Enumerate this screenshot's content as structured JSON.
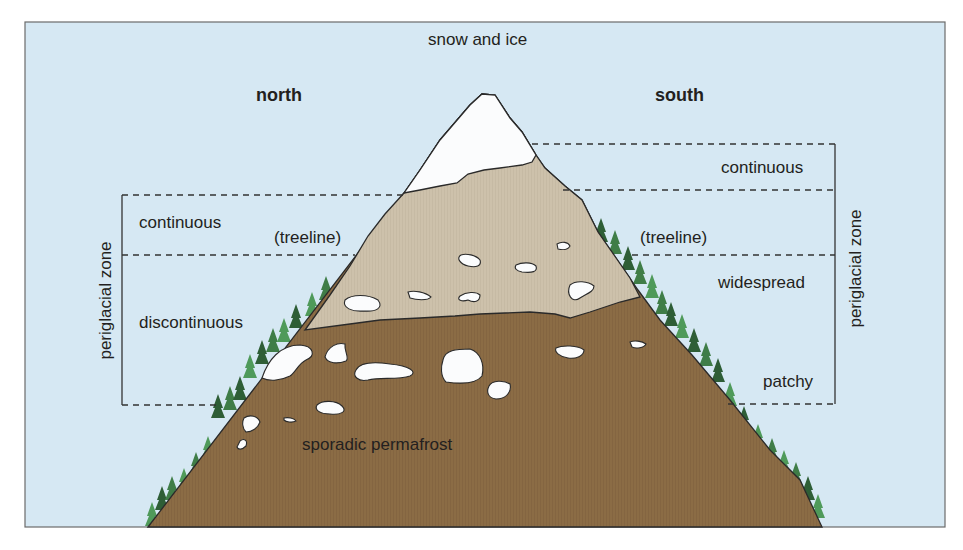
{
  "diagram": {
    "title_top": "snow and ice",
    "aspects": {
      "left": "north",
      "right": "south"
    },
    "north_zones": [
      {
        "label": "continuous",
        "y_top": 195,
        "y_bottom": 255
      },
      {
        "label": "discontinuous",
        "y_top": 255,
        "y_bottom": 405
      }
    ],
    "south_zones": [
      {
        "label": "continuous",
        "y_top": 144,
        "y_bottom": 190
      },
      {
        "label": "widespread",
        "y_top": 255,
        "y_bottom": 300
      },
      {
        "label": "patchy",
        "y_top": 300,
        "y_bottom": 404
      }
    ],
    "treeline_left": "(treeline)",
    "treeline_right": "(treeline)",
    "bracket_label_left": "periglacial zone",
    "bracket_label_right": "periglacial zone",
    "base_label": "sporadic permafrost"
  },
  "colors": {
    "sky": "#d6e8f3",
    "snow": "#fbfcfd",
    "upper_rock": "#cbbfaa",
    "lower_soil": "#8b6c45",
    "tree_dark": "#2e5e36",
    "tree_light": "#4f9a5a",
    "outline": "#2a2a2a",
    "text": "#231f20"
  }
}
